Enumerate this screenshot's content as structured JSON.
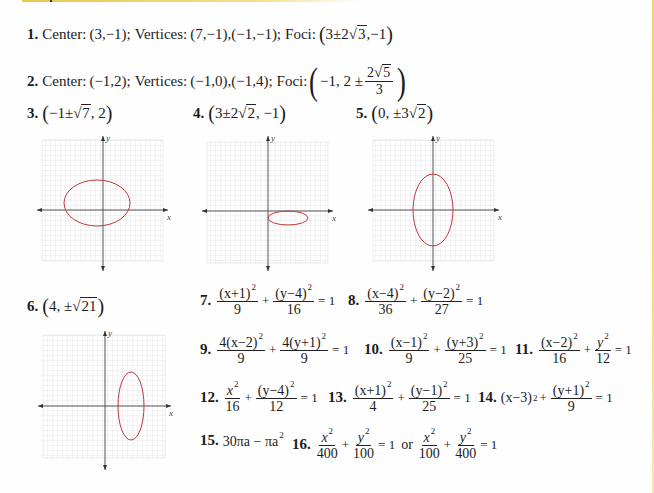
{
  "decor": {
    "top_rule_color": "#e8c84a",
    "right_rule_color": "#f0d468",
    "ellipse_color": "#c0393b"
  },
  "answers": {
    "a1": {
      "num": "1.",
      "center_label": "Center:",
      "center": "(3,−1);",
      "vertices_label": "Vertices:",
      "vertices": "(7,−1),(−1,−1);",
      "foci_label": "Foci:",
      "foci_pre": "3±2",
      "foci_rad": "3",
      "foci_post": ",−1"
    },
    "a2": {
      "num": "2.",
      "center_label": "Center:",
      "center": "(−1,2);",
      "vertices_label": "Vertices:",
      "vertices": "(−1,0),(−1,4);",
      "foci_label": "Foci:",
      "foci_pre": "−1, 2 ±",
      "foci_num_pre": "2",
      "foci_num_rad": "5",
      "foci_den": "3"
    },
    "a3": {
      "num": "3.",
      "pre": "−1±",
      "rad": "7",
      "post": ", 2"
    },
    "a4": {
      "num": "4.",
      "pre": "3±2",
      "rad": "2",
      "post": ", −1"
    },
    "a5": {
      "num": "5.",
      "pre": "0, ±3",
      "rad": "2",
      "post": ""
    },
    "a6": {
      "num": "6.",
      "pre": "4, ±",
      "rad": "21",
      "post": ""
    },
    "a7": {
      "num": "7.",
      "t1n": "(x+1)",
      "t1d": "9",
      "t2n": "(y−4)",
      "t2d": "16",
      "rhs": "= 1"
    },
    "a8": {
      "num": "8.",
      "t1n": "(x−4)",
      "t1d": "36",
      "t2n": "(y−2)",
      "t2d": "27",
      "rhs": "= 1"
    },
    "a9": {
      "num": "9.",
      "t1n": "4(x−2)",
      "t1d": "9",
      "t2n": "4(y+1)",
      "t2d": "9",
      "rhs": "= 1"
    },
    "a10": {
      "num": "10.",
      "t1n": "(x−1)",
      "t1d": "9",
      "t2n": "(y+3)",
      "t2d": "25",
      "rhs": "= 1"
    },
    "a11": {
      "num": "11.",
      "t1n": "(x−2)",
      "t1d": "16",
      "t2n": "y",
      "t2d": "12",
      "rhs": "= 1"
    },
    "a12": {
      "num": "12.",
      "t1n": "x",
      "t1d": "16",
      "t2n": "(y−4)",
      "t2d": "12",
      "rhs": "= 1"
    },
    "a13": {
      "num": "13.",
      "t1n": "(x+1)",
      "t1d": "4",
      "t2n": "(y−1)",
      "t2d": "25",
      "rhs": "= 1"
    },
    "a14": {
      "num": "14.",
      "t1": "(x−3)",
      "t2n": "(y+1)",
      "t2d": "9",
      "rhs": "= 1"
    },
    "a15": {
      "num": "15.",
      "expr_a": "30πa − πa"
    },
    "a16": {
      "num": "16.",
      "t1d": "400",
      "t2d": "100",
      "rhs": "= 1",
      "or": "or",
      "t3d": "100",
      "t4d": "400",
      "rhs2": "= 1",
      "xn": "x",
      "yn": "y"
    },
    "sq": "2",
    "plus": "+"
  },
  "graphs": [
    {
      "id": "g3",
      "axis_x_label": "x",
      "axis_y_label": "y"
    },
    {
      "id": "g4",
      "axis_x_label": "x",
      "axis_y_label": "y"
    },
    {
      "id": "g5",
      "axis_x_label": "x",
      "axis_y_label": "y"
    },
    {
      "id": "g6",
      "axis_x_label": "x",
      "axis_y_label": "y"
    }
  ]
}
